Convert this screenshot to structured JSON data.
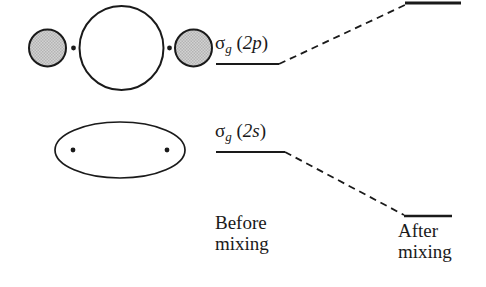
{
  "figure": {
    "background_color": "#ffffff",
    "stroke_color": "#1a1a1a",
    "orbital_fill_gray": "#c9c9c9",
    "orbital_fill_white": "#ffffff"
  },
  "orbitals": {
    "sigma_2p": {
      "name": "sigma-g-2p-orbital-drawing",
      "description": "two small shaded lobes flanking one large unshaded lobe with two nuclei dots"
    },
    "sigma_2s": {
      "name": "sigma-g-2s-orbital-drawing",
      "description": "single large unshaded ellipse enclosing two nuclei dots"
    }
  },
  "levels": {
    "sigma_2p": {
      "symbol": "σ",
      "subscript": "g",
      "open_paren": "(",
      "orbital": "2p",
      "close_paren": ")",
      "full_label": "σg (2p)"
    },
    "sigma_2s": {
      "symbol": "σ",
      "subscript": "g",
      "open_paren": "(",
      "orbital": "2s",
      "close_paren": ")",
      "full_label": "σg (2s)"
    }
  },
  "captions": {
    "before": {
      "line1": "Before",
      "line2": "mixing"
    },
    "after": {
      "line1": "After",
      "line2": "mixing"
    }
  }
}
